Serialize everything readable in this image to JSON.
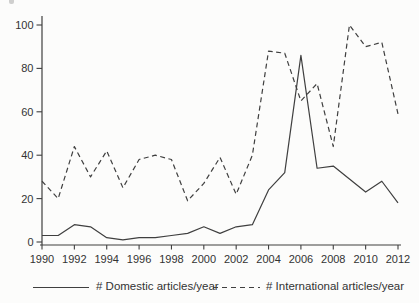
{
  "chart_data": {
    "type": "line",
    "x": [
      1990,
      1991,
      1992,
      1993,
      1994,
      1995,
      1996,
      1997,
      1998,
      1999,
      2000,
      2001,
      2002,
      2003,
      2004,
      2005,
      2006,
      2007,
      2008,
      2009,
      2010,
      2011,
      2012
    ],
    "series": [
      {
        "key": "domestic",
        "name": "# Domestic articles/year",
        "style": "solid",
        "values": [
          3,
          3,
          8,
          7,
          2,
          1,
          2,
          2,
          3,
          4,
          7,
          4,
          7,
          8,
          24,
          32,
          86,
          34,
          35,
          29,
          23,
          28,
          18
        ]
      },
      {
        "key": "international",
        "name": "# International articles/year",
        "style": "dashed",
        "values": [
          28,
          20,
          44,
          30,
          42,
          25,
          38,
          40,
          38,
          19,
          27,
          39,
          22,
          40,
          88,
          87,
          65,
          73,
          44,
          100,
          90,
          92,
          59
        ]
      }
    ],
    "title": "",
    "xlabel": "",
    "ylabel": "",
    "xlim": [
      1990,
      2012
    ],
    "ylim": [
      0,
      100
    ],
    "x_ticks": [
      1990,
      1992,
      1994,
      1996,
      1998,
      2000,
      2002,
      2004,
      2006,
      2008,
      2010,
      2012
    ],
    "y_ticks": [
      0,
      20,
      40,
      60,
      80,
      100
    ],
    "grid": false,
    "legend_position": "bottom",
    "line_color": "#3f3f3f"
  }
}
